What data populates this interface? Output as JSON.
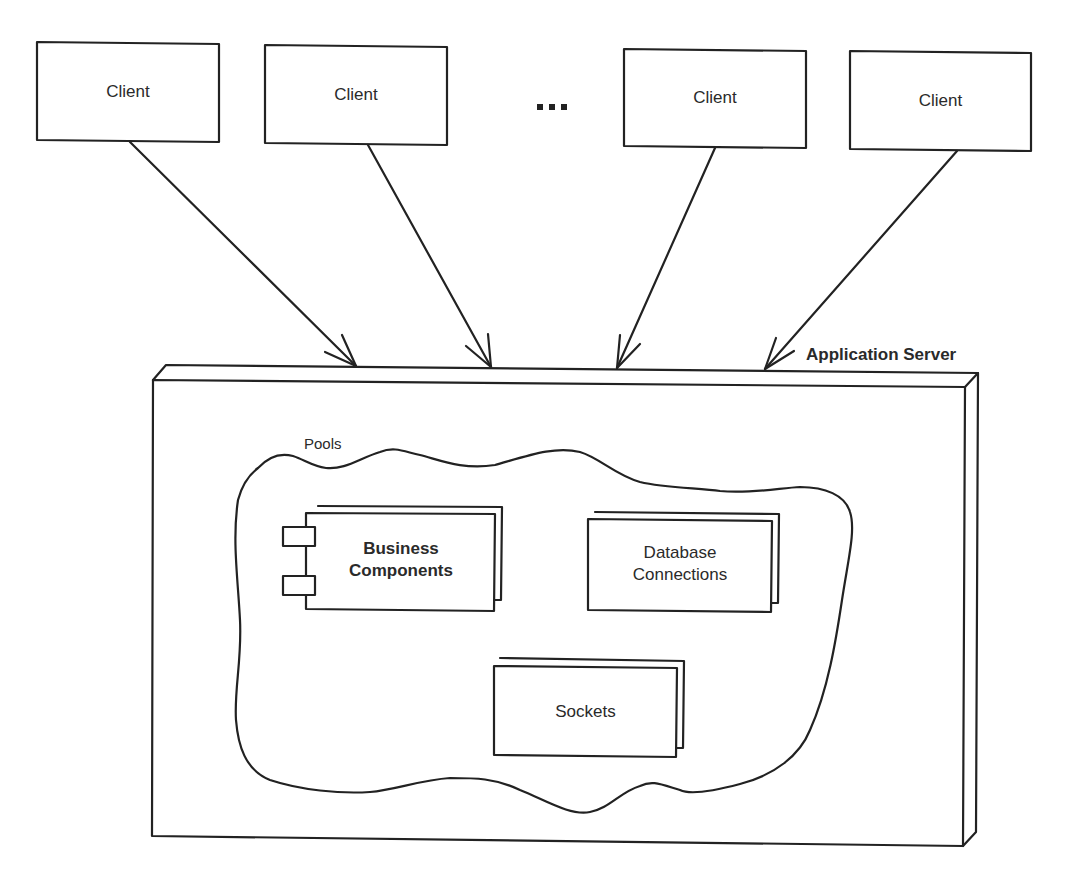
{
  "diagram": {
    "clients": [
      {
        "label": "Client"
      },
      {
        "label": "Client"
      },
      {
        "label": "Client"
      },
      {
        "label": "Client"
      }
    ],
    "ellipsis": "...",
    "server": {
      "label": "Application Server"
    },
    "pools": {
      "label": "Pools",
      "items": [
        {
          "label_line1": "Business",
          "label_line2": "Components",
          "type": "component"
        },
        {
          "label_line1": "Database",
          "label_line2": "Connections",
          "type": "stack"
        },
        {
          "label": "Sockets",
          "type": "stack"
        }
      ]
    },
    "colors": {
      "stroke": "#222222",
      "background": "#ffffff",
      "text": "#2a2a2a"
    }
  }
}
